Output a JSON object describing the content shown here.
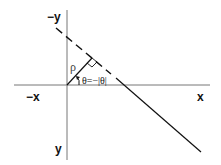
{
  "diagram": {
    "type": "polar line parameterization",
    "axes": {
      "neg_y_label": "−y",
      "pos_y_label": "y",
      "neg_x_label": "−x",
      "pos_x_label": "x"
    },
    "labels": {
      "rho": "ρ",
      "theta": "θ=−|θ|"
    },
    "elements": [
      "horizontal x axis",
      "vertical y axis (y increases downward)",
      "solid line crossing x axis",
      "dashed extension of line",
      "normal segment rho from origin",
      "right-angle marker",
      "angle arrow theta"
    ],
    "colors": {
      "axis": "#666666",
      "line": "#111111"
    }
  }
}
